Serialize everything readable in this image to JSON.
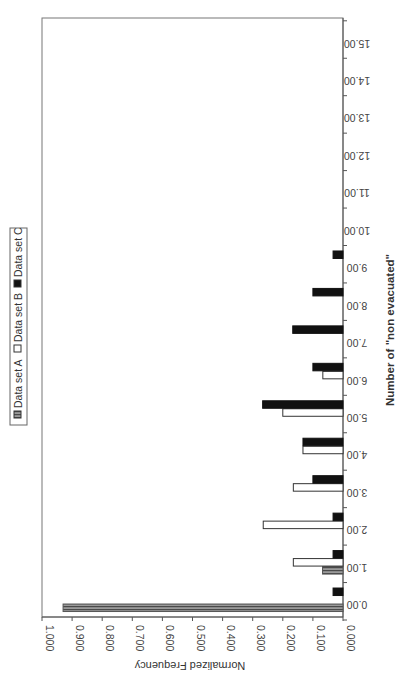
{
  "chart_data": {
    "type": "bar",
    "orientation": "rotated-90-clockwise",
    "title": "",
    "xlabel": "Number of \"non evacuated\"",
    "ylabel": "Normalized Frequency",
    "categories": [
      "0.00",
      "1.00",
      "2.00",
      "3.00",
      "4.00",
      "5.00",
      "6.00",
      "7.00",
      "8.00",
      "9.00",
      "10.00",
      "11.00",
      "12.00",
      "13.00",
      "14.00",
      "15.00"
    ],
    "series": [
      {
        "name": "Data set A",
        "pattern": "vertical-hatch-gray",
        "color": "#8a8a8a",
        "values": [
          0.93,
          0.068,
          0,
          0,
          0,
          0,
          0,
          0,
          0,
          0,
          0,
          0,
          0,
          0,
          0,
          0
        ]
      },
      {
        "name": "Data set B",
        "pattern": "hollow",
        "color": "#ffffff",
        "values": [
          0,
          0.165,
          0.265,
          0.165,
          0.133,
          0.2,
          0.067,
          0,
          0,
          0,
          0,
          0,
          0,
          0,
          0,
          0
        ]
      },
      {
        "name": "Data set C",
        "pattern": "solid-black",
        "color": "#111111",
        "values": [
          0.033,
          0.033,
          0.033,
          0.1,
          0.133,
          0.267,
          0.1,
          0.167,
          0.1,
          0.033,
          0,
          0,
          0,
          0,
          0,
          0
        ]
      }
    ],
    "yticks": [
      "0.000",
      "0.100",
      "0.200",
      "0.300",
      "0.400",
      "0.500",
      "0.600",
      "0.700",
      "0.800",
      "0.900",
      "1.000"
    ],
    "ylim": [
      0,
      1.0
    ],
    "grid": false,
    "legend": {
      "position": "top (rotated left side)",
      "entries": [
        "Data set A",
        "Data set B",
        "Data set C"
      ]
    }
  }
}
